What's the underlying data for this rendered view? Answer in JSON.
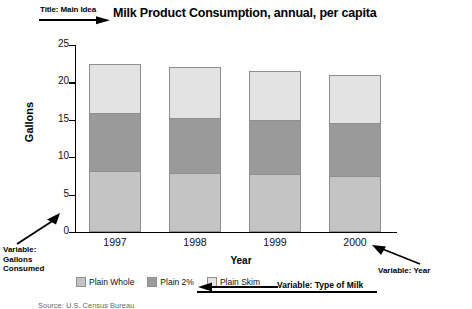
{
  "chart_data": {
    "type": "bar",
    "stacked": true,
    "title": "Milk Product Consumption, annual, per capita",
    "xlabel": "Year",
    "ylabel": "Gallons",
    "categories": [
      "1997",
      "1998",
      "1999",
      "2000"
    ],
    "ylim": [
      0,
      25
    ],
    "yticks": [
      0,
      5,
      10,
      15,
      20,
      25
    ],
    "grid": false,
    "legend_position": "bottom-left",
    "series": [
      {
        "name": "Plain Whole",
        "color": "#c4c4c4",
        "values": [
          8.1,
          7.9,
          7.8,
          7.5
        ]
      },
      {
        "name": "Plain 2%",
        "color": "#9a9a9a",
        "values": [
          7.8,
          7.4,
          7.2,
          7.1
        ]
      },
      {
        "name": "Plain Skim",
        "color": "#e3e3e3",
        "values": [
          6.6,
          6.7,
          6.5,
          6.4
        ]
      }
    ],
    "totals": [
      22.5,
      22.0,
      21.5,
      21.0
    ],
    "annotations": [
      {
        "id": "title",
        "text": "Title: Main Idea",
        "arrow": "right"
      },
      {
        "id": "gallons",
        "text": "Variable:\nGallons\nConsumed",
        "arrow": "up-right"
      },
      {
        "id": "year",
        "text": "Variable: Year",
        "arrow": "left"
      },
      {
        "id": "milk",
        "text": "Variable: Type of Milk",
        "arrow": "left"
      }
    ]
  },
  "annotations": {
    "title_label": "Title: Main Idea",
    "gallons_line1": "Variable:",
    "gallons_line2": "Gallons",
    "gallons_line3": "Consumed",
    "year_label": "Variable: Year",
    "milk_label": "Variable: Type of Milk"
  },
  "source_note": "Source: U.S. Census Bureau"
}
